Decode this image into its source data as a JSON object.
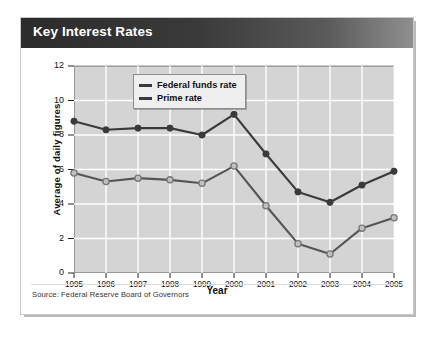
{
  "card": {
    "title": "Key Interest Rates",
    "source": "Source: Federal Reserve Board of Governors"
  },
  "colors": {
    "title_bar_dark": "#2b2b2b",
    "title_bar_light": "#8f8f8f",
    "plot_bg": "#d4d4d4",
    "grid": "#ffffff",
    "prime_rate": "#3a3a3a",
    "federal_funds_rate": "#555555",
    "federal_funds_marker_fill": "#c0c0c0",
    "frame": "#9a9a9a"
  },
  "chart_data": {
    "type": "line",
    "title": "Key Interest Rates",
    "xlabel": "Year",
    "ylabel": "Average of daily figures",
    "categories": [
      "1995",
      "1996",
      "1997",
      "1998",
      "1999",
      "2000",
      "2001",
      "2002",
      "2003",
      "2004",
      "2005"
    ],
    "x": [
      1995,
      1996,
      1997,
      1998,
      1999,
      2000,
      2001,
      2002,
      2003,
      2004,
      2005
    ],
    "xlim": [
      1995,
      2005
    ],
    "ylim": [
      0,
      12
    ],
    "yticks": [
      0,
      2,
      4,
      6,
      8,
      10,
      12
    ],
    "ytick_labels": [
      "0",
      "2",
      "4",
      "6",
      "8",
      "10",
      "12"
    ],
    "xtick_labels": [
      "1995",
      "1996",
      "1997",
      "1998",
      "1999",
      "2000",
      "2001",
      "2002",
      "2003",
      "2004",
      "2005"
    ],
    "grid": true,
    "legend_position": "top-left-inside",
    "series": [
      {
        "name": "Federal funds rate",
        "marker": "open-circle",
        "color": "#555555",
        "values": [
          5.8,
          5.3,
          5.5,
          5.4,
          5.2,
          6.2,
          3.9,
          1.7,
          1.1,
          2.6,
          3.2
        ]
      },
      {
        "name": "Prime rate",
        "marker": "filled-circle",
        "color": "#3a3a3a",
        "values": [
          8.8,
          8.3,
          8.4,
          8.4,
          8.0,
          9.2,
          6.9,
          4.7,
          4.1,
          5.1,
          5.9
        ]
      }
    ]
  }
}
